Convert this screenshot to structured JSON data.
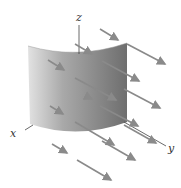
{
  "figure": {
    "axes": {
      "x_label": "x",
      "y_label": "y",
      "z_label": "z"
    },
    "colors": {
      "surface_light": "#d8d8d8",
      "surface_dark": "#7a7a7a",
      "arrow": "#8a8a8a",
      "axis": "#444444",
      "background": "#ffffff"
    },
    "arrows": [
      {
        "x1": 100,
        "y1": 29,
        "x2": 118,
        "y2": 40
      },
      {
        "x1": 75,
        "y1": 44,
        "x2": 92,
        "y2": 54
      },
      {
        "x1": 127,
        "y1": 44,
        "x2": 165,
        "y2": 64
      },
      {
        "x1": 48,
        "y1": 60,
        "x2": 64,
        "y2": 70
      },
      {
        "x1": 102,
        "y1": 61,
        "x2": 139,
        "y2": 81
      },
      {
        "x1": 75,
        "y1": 78,
        "x2": 116,
        "y2": 100
      },
      {
        "x1": 124,
        "y1": 89,
        "x2": 160,
        "y2": 108
      },
      {
        "x1": 88,
        "y1": 97,
        "x2": 92,
        "y2": 99
      },
      {
        "x1": 50,
        "y1": 106,
        "x2": 63,
        "y2": 114
      },
      {
        "x1": 100,
        "y1": 106,
        "x2": 138,
        "y2": 126
      },
      {
        "x1": 124,
        "y1": 125,
        "x2": 156,
        "y2": 143
      },
      {
        "x1": 75,
        "y1": 122,
        "x2": 114,
        "y2": 145
      },
      {
        "x1": 52,
        "y1": 144,
        "x2": 67,
        "y2": 153
      },
      {
        "x1": 102,
        "y1": 141,
        "x2": 135,
        "y2": 160
      },
      {
        "x1": 77,
        "y1": 160,
        "x2": 111,
        "y2": 180
      }
    ]
  }
}
